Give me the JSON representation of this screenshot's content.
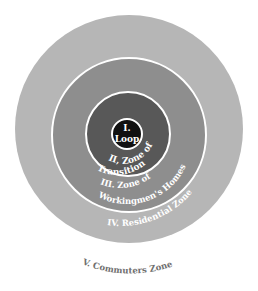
{
  "diagram": {
    "type": "concentric-zone-model",
    "colors": {
      "background": "#ffffff",
      "zone_v_outer_fill": "#b6b6b6",
      "zone_iv_fill": "#b6b6b6",
      "zone_iii_fill": "#8e8e8e",
      "zone_ii_fill": "#585858",
      "zone_i_fill": "#111111",
      "ring_stroke": "#ffffff",
      "outer_label": "#6f6f6f"
    },
    "zones": [
      {
        "id": "I",
        "label_line1": "I.",
        "label_line2": "Loop"
      },
      {
        "id": "II",
        "label_line1": "II, Zone of",
        "label_line2": "Transition"
      },
      {
        "id": "III",
        "label_line1": "III. Zone of",
        "label_line2": "Workingmen's Homes"
      },
      {
        "id": "IV",
        "label": "IV. Residential Zone"
      },
      {
        "id": "V",
        "label": "V. Commuters Zone"
      }
    ]
  }
}
